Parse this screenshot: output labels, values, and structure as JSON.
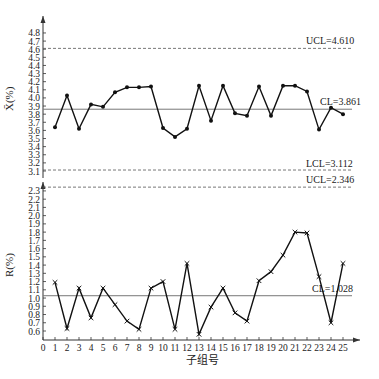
{
  "chart_data": [
    {
      "type": "line",
      "title": "",
      "xlabel": "子组号",
      "ylabel": "X̄(%)",
      "ylim": [
        3.1,
        4.8
      ],
      "yticks": [
        3.1,
        3.2,
        3.3,
        3.4,
        3.5,
        3.6,
        3.7,
        3.8,
        3.9,
        4.0,
        4.1,
        4.2,
        4.3,
        4.4,
        4.5,
        4.6,
        4.7,
        4.8
      ],
      "x": [
        1,
        2,
        3,
        4,
        5,
        6,
        7,
        8,
        9,
        10,
        11,
        12,
        13,
        14,
        15,
        16,
        17,
        18,
        19,
        20,
        21,
        22,
        23,
        24,
        25
      ],
      "series": [
        {
          "name": "X̄",
          "marker": "dot",
          "values": [
            3.64,
            4.03,
            3.62,
            3.92,
            3.89,
            4.07,
            4.13,
            4.13,
            4.14,
            3.63,
            3.52,
            3.62,
            4.15,
            3.72,
            4.15,
            3.81,
            3.78,
            4.14,
            3.78,
            4.15,
            4.15,
            4.08,
            3.61,
            3.88,
            3.8
          ]
        }
      ],
      "control_lines": [
        {
          "name": "UCL",
          "value": 4.61,
          "label": "UCL=4.610",
          "style": "dashed"
        },
        {
          "name": "CL",
          "value": 3.861,
          "label": "CL=3.861",
          "style": "solid"
        },
        {
          "name": "LCL",
          "value": 3.112,
          "label": "LCL=3.112",
          "style": "dashed"
        }
      ],
      "grid": false
    },
    {
      "type": "line",
      "title": "",
      "xlabel": "子组号",
      "ylabel": "R(%)",
      "ylim": [
        0.5,
        2.4
      ],
      "yticks": [
        0.6,
        0.7,
        0.8,
        0.9,
        1.0,
        1.1,
        1.2,
        1.3,
        1.4,
        1.5,
        1.6,
        1.7,
        1.8,
        1.9,
        2.0,
        2.1,
        2.2,
        2.3
      ],
      "xticks": [
        0,
        1,
        2,
        3,
        4,
        5,
        6,
        7,
        8,
        9,
        10,
        11,
        12,
        13,
        14,
        15,
        16,
        17,
        18,
        19,
        20,
        21,
        22,
        23,
        24,
        25
      ],
      "x": [
        1,
        2,
        3,
        4,
        5,
        6,
        7,
        8,
        9,
        10,
        11,
        12,
        13,
        14,
        15,
        16,
        17,
        18,
        19,
        20,
        21,
        22,
        23,
        24,
        25
      ],
      "series": [
        {
          "name": "R",
          "marker": "x",
          "values": [
            1.19,
            0.63,
            1.12,
            0.76,
            1.12,
            0.92,
            0.72,
            0.62,
            1.12,
            1.2,
            0.62,
            1.42,
            0.56,
            0.89,
            1.12,
            0.82,
            0.72,
            1.21,
            1.32,
            1.52,
            1.8,
            1.79,
            1.26,
            0.7,
            1.42
          ]
        }
      ],
      "control_lines": [
        {
          "name": "UCL",
          "value": 2.346,
          "label": "UCL=2.346",
          "style": "dashed"
        },
        {
          "name": "CL",
          "value": 1.028,
          "label": "CL=1.028",
          "style": "solid"
        }
      ],
      "grid": false
    }
  ],
  "labels": {
    "top_ylabel": "X̄(%)",
    "bottom_ylabel": "R(%)",
    "xlabel": "子组号",
    "top_ucl": "UCL=4.610",
    "top_cl": "CL=3.861",
    "top_lcl": "LCL=3.112",
    "bottom_ucl": "UCL=2.346",
    "bottom_cl": "CL=1.028"
  }
}
